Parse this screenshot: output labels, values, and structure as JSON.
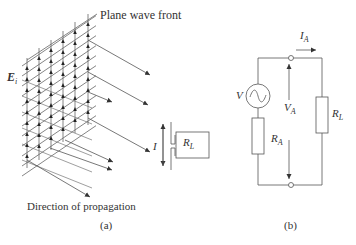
{
  "panel_a": {
    "caption": "(a)",
    "wave_front_label": "Plane wave front",
    "e_field_label": {
      "main": "E",
      "sub": "i"
    },
    "propagation_label": "Direction of propagation",
    "current_label": "I",
    "load_label": {
      "main": "R",
      "sub": "L"
    },
    "grid": {
      "vertical_lines_x": [
        27,
        39,
        51,
        63,
        75,
        88
      ],
      "vertical_tops": [
        58,
        48,
        40,
        31,
        22,
        14
      ],
      "vertical_bottoms": [
        168,
        160,
        150,
        142,
        133,
        125
      ],
      "field_arrow_rows": 10
    },
    "propagation_arrows": [
      {
        "x1": 88,
        "y1": 40,
        "x2": 150,
        "y2": 75
      },
      {
        "x1": 88,
        "y1": 72,
        "x2": 148,
        "y2": 105
      },
      {
        "x1": 88,
        "y1": 92,
        "x2": 112,
        "y2": 102
      },
      {
        "x1": 88,
        "y1": 118,
        "x2": 150,
        "y2": 152
      },
      {
        "x1": 65,
        "y1": 140,
        "x2": 113,
        "y2": 162
      },
      {
        "x1": 50,
        "y1": 148,
        "x2": 112,
        "y2": 170
      },
      {
        "x1": 27,
        "y1": 160,
        "x2": 90,
        "y2": 197
      }
    ],
    "dipole": {
      "x": 170,
      "top": 125,
      "bottom": 165,
      "gap_y": 146
    }
  },
  "panel_b": {
    "caption": "(b)",
    "source_label": "V",
    "voltage_label": {
      "main": "V",
      "sub": "A"
    },
    "current_label": {
      "main": "I",
      "sub": "A"
    },
    "antenna_resistance_label": {
      "main": "R",
      "sub": "A"
    },
    "load_resistance_label": {
      "main": "R",
      "sub": "L"
    }
  },
  "colors": {
    "line": "#555555",
    "text": "#333333",
    "background": "#ffffff"
  }
}
